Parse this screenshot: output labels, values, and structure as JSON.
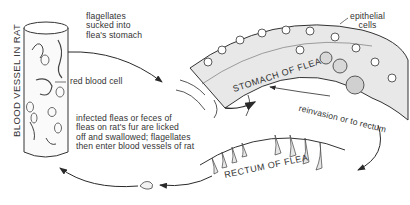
{
  "diagram": {
    "type": "life-cycle illustration",
    "labels": {
      "blood_vessel": "BLOOD VESSEL IN RAT",
      "flagellates_sucked_line1": "flagellates",
      "flagellates_sucked_line2": "sucked into",
      "flagellates_sucked_line3": "flea's stomach",
      "red_blood_cell": "red blood cell",
      "epithelial_line1": "epithelial",
      "epithelial_line2": "cells",
      "stomach": "STOMACH OF FLEA",
      "reinvasion": "reinvasion or to rectum",
      "rectum": "RECTUM OF FLEA",
      "infected_line1": "infected fleas or feces of",
      "infected_line2": "fleas on rat's fur are licked",
      "infected_line3": "off and swallowed; flagellates",
      "infected_line4": "then enter blood vessels of rat"
    },
    "colors": {
      "ink": "#2a2a2a",
      "tissue_fill": "#e6e6e6",
      "background": "#ffffff"
    },
    "arrows": [
      {
        "from": "blood-vessel",
        "to": "stomach-of-flea",
        "meaning": "flagellates sucked into flea's stomach"
      },
      {
        "from": "stomach-of-flea",
        "to": "stomach-of-flea",
        "meaning": "reinvasion"
      },
      {
        "from": "stomach-of-flea",
        "to": "rectum-of-flea",
        "meaning": "to rectum"
      },
      {
        "from": "rectum-of-flea",
        "to": "blood-vessel",
        "meaning": "feces licked and swallowed"
      }
    ]
  }
}
